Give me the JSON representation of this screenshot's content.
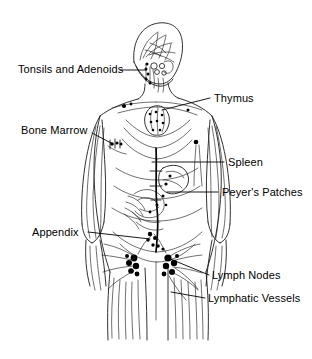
{
  "diagram": {
    "background_color": "#ffffff",
    "line_color": "#000000",
    "labels": [
      {
        "id": "tonsils-and-adenoids",
        "text": "Tonsils and Adenoids",
        "side": "left",
        "x": 18,
        "y": 63,
        "leader_from": [
          120,
          70
        ],
        "leader_to": [
          146,
          70
        ]
      },
      {
        "id": "bone-marrow",
        "text": "Bone Marrow",
        "side": "left",
        "x": 21,
        "y": 124,
        "leader_from": [
          92,
          133
        ],
        "leader_to": [
          113,
          144
        ]
      },
      {
        "id": "appendix",
        "text": "Appendix",
        "side": "left",
        "x": 32,
        "y": 226,
        "leader_from": [
          88,
          232
        ],
        "leader_to": [
          150,
          239
        ]
      },
      {
        "id": "thymus",
        "text": "Thymus",
        "side": "right",
        "x": 214,
        "y": 92,
        "leader_from": [
          210,
          98
        ],
        "leader_to": [
          162,
          110
        ]
      },
      {
        "id": "spleen",
        "text": "Spleen",
        "side": "right",
        "x": 228,
        "y": 156,
        "leader_from": [
          224,
          162
        ],
        "leader_to": [
          152,
          162
        ]
      },
      {
        "id": "peyers-patches",
        "text": "Peyer's Patches",
        "side": "right",
        "x": 222,
        "y": 186,
        "leader_from": [
          218,
          192
        ],
        "leader_to": [
          167,
          192
        ]
      },
      {
        "id": "lymph-nodes",
        "text": "Lymph Nodes",
        "side": "right",
        "x": 212,
        "y": 269,
        "leader_from": [
          209,
          275
        ],
        "leader_to": [
          168,
          258
        ]
      },
      {
        "id": "lymphatic-vessels",
        "text": "Lymphatic Vessels",
        "side": "right",
        "x": 208,
        "y": 292,
        "leader_from": [
          205,
          298
        ],
        "leader_to": [
          171,
          292
        ]
      }
    ]
  }
}
